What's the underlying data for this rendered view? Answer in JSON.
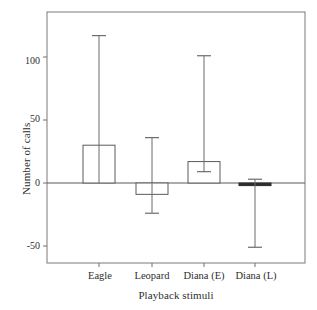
{
  "chart_data": {
    "type": "bar",
    "title": "",
    "xlabel": "Playback stimuli",
    "ylabel": "Number of calls",
    "categories": [
      "Eagle",
      "Leopard",
      "Diana (E)",
      "Diana (L)"
    ],
    "values": [
      30,
      -9,
      17,
      -2
    ],
    "error_high": [
      117,
      36,
      101,
      3
    ],
    "error_low": [
      0,
      -24,
      9,
      -51
    ],
    "ylim": [
      -63,
      136
    ],
    "yticks": [
      -50,
      0,
      50,
      100
    ],
    "ytick_labels": [
      "-50",
      "0",
      "50",
      "100"
    ],
    "grid": false,
    "legend": false,
    "bar_facecolor": "#ffffff",
    "bar_edgecolor": "#4a4a4a",
    "axis_color": "#6f6f6f",
    "text_color": "#2e2e2e",
    "series": [
      {
        "name": "Number of calls",
        "values": [
          30,
          -9,
          17,
          -2
        ]
      }
    ]
  },
  "axes": {
    "y_title": "Number of calls",
    "x_title": "Playback stimuli",
    "y_ticks": [
      {
        "label": "100",
        "value": 100
      },
      {
        "label": "50",
        "value": 50
      },
      {
        "label": "0",
        "value": 0
      },
      {
        "label": "-50",
        "value": -50
      }
    ],
    "x_ticks": [
      {
        "label": "Eagle"
      },
      {
        "label": "Leopard"
      },
      {
        "label": "Diana (E)"
      },
      {
        "label": "Diana (L)"
      }
    ]
  }
}
